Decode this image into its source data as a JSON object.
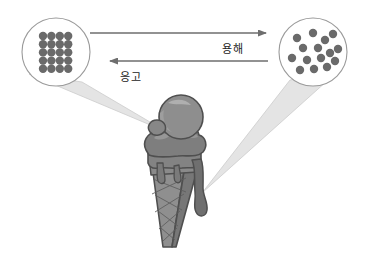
{
  "figure": {
    "title": "",
    "type": "state-change-diagram",
    "background_color": "#ffffff"
  },
  "arrows": {
    "forward": {
      "label": "용해",
      "direction": "right",
      "meaning": "melting",
      "x1": 90,
      "y1": 33,
      "x2": 268,
      "y2": 33,
      "color": "#6e6e6e"
    },
    "reverse": {
      "label": "응고",
      "direction": "left",
      "meaning": "freezing",
      "x1": 268,
      "y1": 61,
      "x2": 108,
      "y2": 61,
      "color": "#6e6e6e"
    }
  },
  "callouts": {
    "left": {
      "name": "solid-lattice-callout",
      "circle": {
        "cx": 56,
        "cy": 52,
        "r": 34
      },
      "stroke_color": "#9a9a9a",
      "fill_color": "#ffffff",
      "particle_color": "#6a6a6a",
      "arrangement": "ordered-lattice",
      "rows": 5,
      "cols": 4,
      "particle_radius": 4.2,
      "spacing_x": 8.4,
      "spacing_y": 8.2,
      "origin_x": 43,
      "origin_y": 36,
      "ray_fill": "#e4e4e4",
      "ray_stroke": "#c9c9c9",
      "ray_apex_x": 167,
      "ray_apex_y": 132,
      "ray_base_x1": 29,
      "ray_base_y1": 74,
      "ray_base_x2": 82,
      "ray_base_y2": 82
    },
    "right": {
      "name": "liquid-particles-callout",
      "circle": {
        "cx": 313,
        "cy": 52,
        "r": 34
      },
      "stroke_color": "#9a9a9a",
      "fill_color": "#ffffff",
      "particle_color": "#6a6a6a",
      "arrangement": "random-disordered",
      "particle_radius": 4.2,
      "particles": [
        {
          "x": 297,
          "y": 38
        },
        {
          "x": 313,
          "y": 33
        },
        {
          "x": 325,
          "y": 40
        },
        {
          "x": 333,
          "y": 34
        },
        {
          "x": 303,
          "y": 48
        },
        {
          "x": 318,
          "y": 48
        },
        {
          "x": 330,
          "y": 53
        },
        {
          "x": 338,
          "y": 49
        },
        {
          "x": 292,
          "y": 58
        },
        {
          "x": 307,
          "y": 60
        },
        {
          "x": 321,
          "y": 58
        },
        {
          "x": 335,
          "y": 61
        },
        {
          "x": 300,
          "y": 70
        },
        {
          "x": 314,
          "y": 69
        },
        {
          "x": 327,
          "y": 67
        }
      ],
      "ray_fill": "#e4e4e4",
      "ray_stroke": "#c9c9c9",
      "ray_apex_x": 202,
      "ray_apex_y": 193,
      "ray_base_x1": 290,
      "ray_base_y1": 80,
      "ray_base_x2": 337,
      "ray_base_y2": 72
    }
  },
  "ice_cream": {
    "name": "melting-ice-cream-cone",
    "outline_color": "#4f4f4f",
    "scoop_top_color": "#8c8c8c",
    "scoop_top_highlight": "#a8a8a8",
    "scoop_bottom_color": "#7b7b7b",
    "cone_color": "#8a8a8a",
    "cone_shadow_color": "#6f6f6f",
    "drip_color": "#6f6f6f",
    "waffle_line_color": "#5a5a5a",
    "description": "grey ice cream cone with two scoops melting and dripping down the side"
  }
}
